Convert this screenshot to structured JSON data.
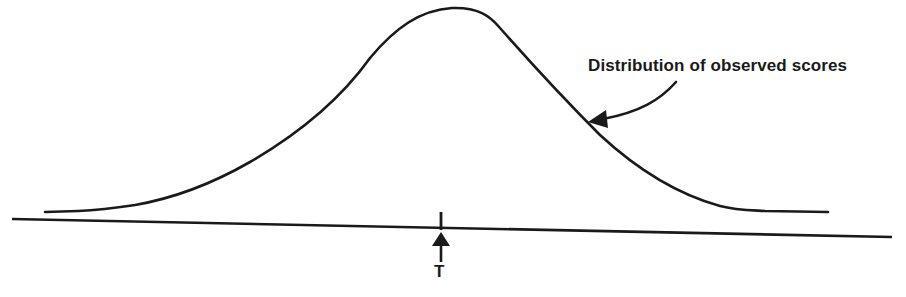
{
  "diagram": {
    "annotation": {
      "text": "Distribution of observed scores",
      "points_to": "curve"
    },
    "marker": {
      "label": "T",
      "meaning": "true score",
      "x_position": 440
    },
    "curve": {
      "shape": "normal distribution",
      "peak_x": 450,
      "peak_y": 8
    },
    "colors": {
      "ink": "#1a1a1a",
      "background": "#ffffff"
    }
  }
}
